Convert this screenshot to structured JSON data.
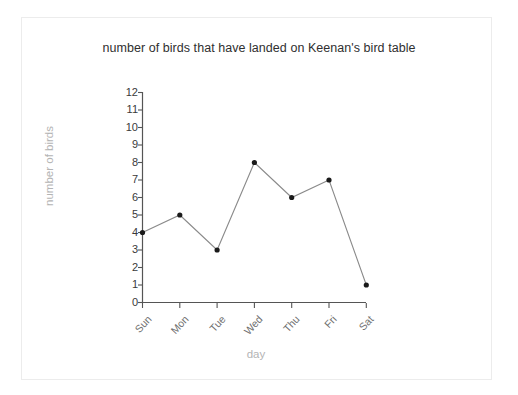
{
  "chart_data": {
    "type": "line",
    "title": "number of birds that have landed on Keenan's bird table",
    "xlabel": "day",
    "ylabel": "number of birds",
    "categories": [
      "Sun",
      "Mon",
      "Tue",
      "Wed",
      "Thu",
      "Fri",
      "Sat"
    ],
    "values": [
      4,
      5,
      3,
      8,
      6,
      7,
      1
    ],
    "ylim": [
      0,
      12
    ],
    "ytick_labels": [
      "0",
      "1",
      "2",
      "3",
      "4",
      "5",
      "6",
      "7",
      "8",
      "9",
      "10",
      "11",
      "12"
    ],
    "yticks": [
      0,
      1,
      2,
      3,
      4,
      5,
      6,
      7,
      8,
      9,
      10,
      11,
      12
    ],
    "grid": false,
    "legend": null,
    "marker": "filled-circle",
    "line_color": "#8a8a8a",
    "marker_color": "#1a1a1a",
    "axis_color": "#555555",
    "title_color": "#2f2f2f",
    "axis_label_color": "#b4b4b4",
    "tick_label_color": "#3a3a3a",
    "xtick_label_color": "#6e6e6e"
  }
}
